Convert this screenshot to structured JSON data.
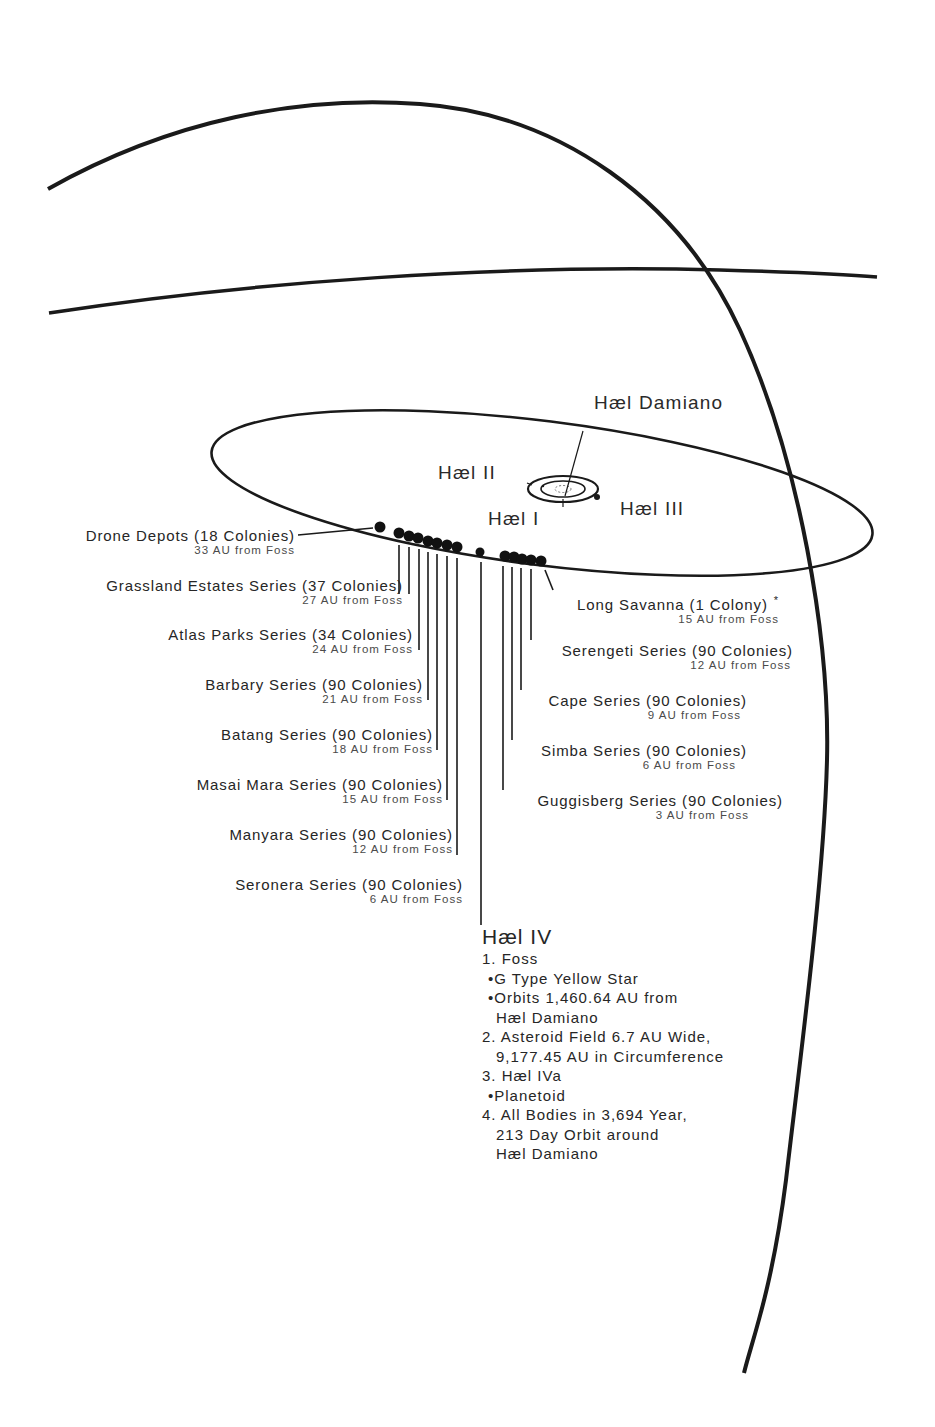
{
  "diagram": {
    "bodies": {
      "star": "Hæl Damiano",
      "planet_i": "Hæl I",
      "planet_ii": "Hæl II",
      "planet_iii": "Hæl III"
    },
    "left_series": [
      {
        "name": "Drone Depots (18 Colonies)",
        "distance": "33 AU from Foss"
      },
      {
        "name": "Grassland Estates Series (37 Colonies)",
        "distance": "27 AU from Foss"
      },
      {
        "name": "Atlas Parks Series (34 Colonies)",
        "distance": "24 AU from Foss"
      },
      {
        "name": "Barbary Series (90 Colonies)",
        "distance": "21 AU from Foss"
      },
      {
        "name": "Batang Series (90 Colonies)",
        "distance": "18 AU from Foss"
      },
      {
        "name": "Masai Mara Series (90 Colonies)",
        "distance": "15 AU from Foss"
      },
      {
        "name": "Manyara Series (90 Colonies)",
        "distance": "12 AU from Foss"
      },
      {
        "name": "Seronera Series (90 Colonies)",
        "distance": "6 AU from Foss"
      }
    ],
    "right_series": [
      {
        "name": "Long Savanna (1 Colony)",
        "marker": "*",
        "distance": "15 AU from Foss"
      },
      {
        "name": "Serengeti Series (90 Colonies)",
        "distance": "12 AU from Foss"
      },
      {
        "name": "Cape Series (90 Colonies)",
        "distance": "9 AU from Foss"
      },
      {
        "name": "Simba Series (90 Colonies)",
        "distance": "6 AU from Foss"
      },
      {
        "name": "Guggisberg Series (90 Colonies)",
        "distance": "3 AU from Foss"
      }
    ],
    "hael_iv": {
      "title": "Hæl IV",
      "lines": [
        "1. Foss",
        "•G Type Yellow Star",
        "•Orbits 1,460.64 AU from",
        "Hæl Damiano",
        "2. Asteroid Field 6.7 AU Wide,",
        "9,177.45 AU in Circumference",
        "3. Hæl IVa",
        "•Planetoid",
        "4. All Bodies in 3,694 Year,",
        "213 Day Orbit around",
        "Hæl Damiano"
      ]
    },
    "colors": {
      "ink": "#1a1a1a",
      "text": "#262626",
      "subtext": "#4a4a4a",
      "background": "#ffffff"
    }
  }
}
